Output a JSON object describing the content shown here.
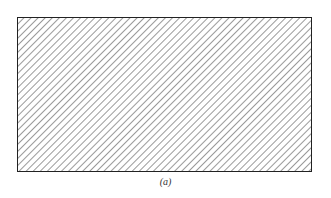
{
  "figure": {
    "caption": "(a)",
    "shape": "rectangle",
    "fill_pattern": "diagonal-hatch",
    "hatch_direction": "bottom-left to top-right",
    "hatch_spacing_px": 5,
    "stroke_color": "#222222",
    "hatch_color": "#555555"
  }
}
